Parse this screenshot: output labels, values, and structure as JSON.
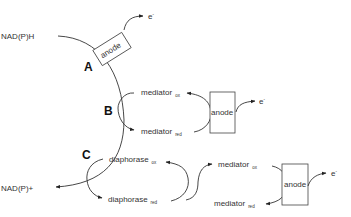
{
  "diagram": {
    "substrate": "NAD(P)H",
    "product": "NAD(P)+",
    "electron": "e-",
    "electron_sup": "-",
    "routes": [
      {
        "label": "A",
        "description": "direct electron transfer",
        "anode": "anode"
      },
      {
        "label": "B",
        "description": "mediated electron transfer",
        "mediator_ox": "mediator",
        "mediator_ox_sub": "ox",
        "mediator_red": "mediator",
        "mediator_red_sub": "red",
        "anode": "anode"
      },
      {
        "label": "C",
        "description": "diaphorase-coupled mediated electron transfer",
        "diaphorase_ox": "diaphorase",
        "diaphorase_ox_sub": "ox",
        "diaphorase_red": "diaphorase",
        "diaphorase_red_sub": "red",
        "mediator_ox": "mediator",
        "mediator_ox_sub": "ox",
        "mediator_red": "mediator",
        "mediator_red_sub": "red",
        "anode": "anode"
      }
    ]
  }
}
